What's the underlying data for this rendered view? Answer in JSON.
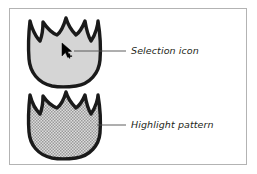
{
  "figure": {
    "frame": {
      "border_color": "#b3b3b3",
      "background_color": "#ffffff"
    },
    "shapes": [
      {
        "name": "tulip-solid-fill",
        "fill_style": "solid",
        "fill_color": "#d5d5d5",
        "outline_color": "#1a1a1a",
        "contains_cursor": true
      },
      {
        "name": "tulip-highlight-pattern",
        "fill_style": "halftone-dot-pattern",
        "fill_color": "#c9c9c9",
        "pattern_dot_color": "#8c8c8c",
        "outline_color": "#1a1a1a",
        "contains_cursor": false
      }
    ],
    "annotations": [
      {
        "id": "selection-icon",
        "label": "Selection icon",
        "leader_from_x": 74,
        "leader_to_x": 126,
        "leader_y": 51
      },
      {
        "id": "highlight-pattern",
        "label": "Highlight pattern",
        "leader_from_x": 97,
        "leader_to_x": 126,
        "leader_y": 125
      }
    ],
    "cursor": {
      "name": "selection-arrow-cursor",
      "color": "#000000",
      "x": 62,
      "y": 43
    }
  }
}
